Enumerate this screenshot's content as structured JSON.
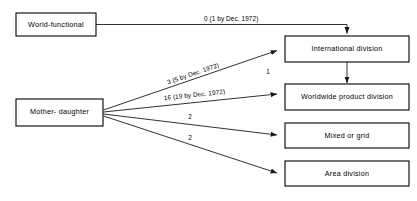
{
  "diagram": {
    "background_color": "#ffffff",
    "line_color": "#1a1a1a",
    "box_fill": "#ffffff",
    "box_stroke": "#000000",
    "source_nodes": [
      {
        "id": "world-functional",
        "label": "World-functional"
      },
      {
        "id": "mother-daughter",
        "label": "Mother- daughter"
      }
    ],
    "target_nodes": [
      {
        "id": "international-division",
        "label": "International division"
      },
      {
        "id": "worldwide-product-division",
        "label": "Worldwide product division"
      },
      {
        "id": "mixed-or-grid",
        "label": "Mixed or grid"
      },
      {
        "id": "area-division",
        "label": "Area division"
      }
    ],
    "edges": [
      {
        "id": "edge-wf-to-international",
        "from": "world-functional",
        "to": "international-division",
        "label": "0 (1 by Dec. 1972)"
      },
      {
        "id": "edge-md-to-international",
        "from": "mother-daughter",
        "to": "international-division",
        "label": "3 (5 by Dec. 1972)"
      },
      {
        "id": "edge-md-to-worldwide-product",
        "from": "mother-daughter",
        "to": "worldwide-product-division",
        "label": "16 (19 by Dec. 1972)"
      },
      {
        "id": "edge-md-to-mixed-or-grid",
        "from": "mother-daughter",
        "to": "mixed-or-grid",
        "label": "2"
      },
      {
        "id": "edge-md-to-area-division",
        "from": "mother-daughter",
        "to": "area-division",
        "label": "2"
      },
      {
        "id": "edge-international-to-worldwide-product",
        "from": "international-division",
        "to": "worldwide-product-division",
        "label": "1"
      }
    ]
  }
}
